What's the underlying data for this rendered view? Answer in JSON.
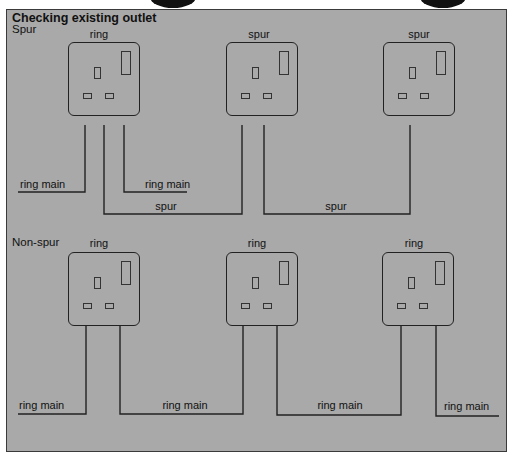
{
  "diagram": {
    "title": "Checking existing outlet",
    "sections": [
      {
        "label": "Spur",
        "sockets": [
          {
            "label": "ring"
          },
          {
            "label": "spur"
          },
          {
            "label": "spur"
          }
        ],
        "wire_labels": [
          "ring main",
          "ring main",
          "spur",
          "spur"
        ]
      },
      {
        "label": "Non-spur",
        "sockets": [
          {
            "label": "ring"
          },
          {
            "label": "ring"
          },
          {
            "label": "ring"
          }
        ],
        "wire_labels": [
          "ring main",
          "ring main",
          "ring main",
          "ring main"
        ]
      }
    ],
    "colors": {
      "panel_bg": "#a9a9a9",
      "line": "#222222"
    }
  }
}
